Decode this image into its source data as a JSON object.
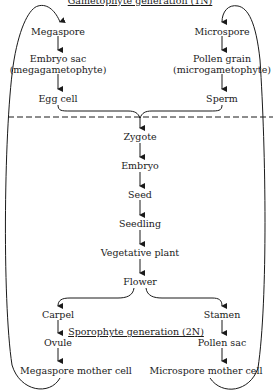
{
  "diagram": {
    "gametophyte_title": "Gametophyte generation (1N)",
    "sporophyte_title": "Sporophyte generation (2N)",
    "left_gametophyte": {
      "megaspore": "Megaspore",
      "embryo_sac_1": "Embryo sac",
      "embryo_sac_2": "(megagametophyte)",
      "egg_cell": "Egg cell"
    },
    "right_gametophyte": {
      "microspore": "Microspore",
      "pollen_grain_1": "Pollen grain",
      "pollen_grain_2": "(microgametophyte)",
      "sperm": "Sperm"
    },
    "center_chain": {
      "zygote": "Zygote",
      "embryo": "Embryo",
      "seed": "Seed",
      "seedling": "Seedling",
      "vegetative_plant": "Vegetative plant",
      "flower": "Flower"
    },
    "left_sporophyte": {
      "carpel": "Carpel",
      "ovule": "Ovule",
      "megaspore_mother_cell": "Megaspore mother cell"
    },
    "right_sporophyte": {
      "stamen": "Stamen",
      "pollen_sac": "Pollen sac",
      "microspore_mother_cell": "Microspore mother cell"
    },
    "colors": {
      "line": "#1a1a1a",
      "background": "#ffffff"
    }
  }
}
